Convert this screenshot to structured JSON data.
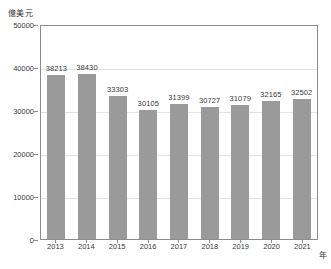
{
  "chart_data": {
    "type": "bar",
    "title": "",
    "subtitle": "",
    "xlabel": "年",
    "ylabel": "億美元",
    "categories": [
      "2013",
      "2014",
      "2015",
      "2016",
      "2017",
      "2018",
      "2019",
      "2020",
      "2021"
    ],
    "values": [
      38213,
      38430,
      33303,
      30105,
      31399,
      30727,
      31079,
      32165,
      32502
    ],
    "value_labels": [
      "38213",
      "38430",
      "33303",
      "30105",
      "31399",
      "30727",
      "31079",
      "32165",
      "32502"
    ],
    "series": [
      {
        "name": "",
        "values": [
          38213,
          38430,
          33303,
          30105,
          31399,
          30727,
          31079,
          32165,
          32502
        ]
      }
    ],
    "ylim": [
      0,
      50000
    ],
    "ytick_values": [
      50000,
      40000,
      30000,
      20000,
      10000,
      0
    ],
    "ytick_labels": [
      "50000",
      "40000",
      "30000",
      "20000",
      "10000",
      "0"
    ],
    "xtick_labels": [
      "2013",
      "2014",
      "2015",
      "2016",
      "2017",
      "2018",
      "2019",
      "2020",
      "2021"
    ],
    "grid": true,
    "grid_axis": "y",
    "legend": false,
    "legend_position": "none",
    "annotations": [],
    "colors": {
      "bar": "#9a9a9a",
      "gridline": "#e3e3e3",
      "axis": "#8c8c8c",
      "text": "#3a3a3a",
      "background": "#ffffff"
    }
  }
}
